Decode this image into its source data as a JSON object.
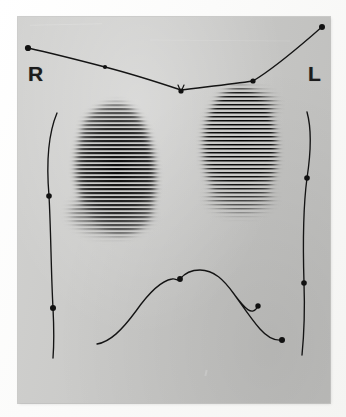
{
  "image": {
    "kind": "lung-perfusion-scintigram",
    "modality_note": "raster-line nuclear medicine scan print",
    "plate": {
      "x": 18,
      "y": 17,
      "width": 312,
      "height": 386,
      "background_color": "#c9c9c7"
    },
    "canvas": {
      "width": 346,
      "height": 417,
      "background_color": "#fbfbfa"
    }
  },
  "labels": {
    "right_side": "R",
    "left_side": "L"
  },
  "colors": {
    "ink": "#141414",
    "plate_grey": "#c9c9c7",
    "mount_white": "#fbfbfa",
    "activity_dark": "#111111"
  },
  "annotations": {
    "apex_marker": "V",
    "markers_total": 11,
    "curves": [
      {
        "name": "upper-thoracic-outline",
        "marker_count": 4
      },
      {
        "name": "right-lateral-chest-wall",
        "marker_count": 2
      },
      {
        "name": "left-lateral-chest-wall",
        "marker_count": 2
      },
      {
        "name": "diaphragm-outline",
        "marker_count": 3
      }
    ],
    "marker_points": [
      {
        "name": "upper-outline-right-end",
        "x": 28,
        "y": 48
      },
      {
        "name": "upper-outline-right-mid",
        "x": 105,
        "y": 67
      },
      {
        "name": "upper-outline-apex",
        "x": 181,
        "y": 90
      },
      {
        "name": "upper-outline-left-mid",
        "x": 253,
        "y": 81
      },
      {
        "name": "upper-outline-left-end",
        "x": 322,
        "y": 27
      },
      {
        "name": "right-wall-upper",
        "x": 49,
        "y": 196
      },
      {
        "name": "right-wall-lower",
        "x": 53,
        "y": 308
      },
      {
        "name": "left-wall-upper",
        "x": 307,
        "y": 178
      },
      {
        "name": "left-wall-lower",
        "x": 304,
        "y": 283
      },
      {
        "name": "diaphragm-centre-notch",
        "x": 180,
        "y": 279
      },
      {
        "name": "diaphragm-left-mid",
        "x": 258,
        "y": 306
      },
      {
        "name": "diaphragm-left-end",
        "x": 282,
        "y": 340
      }
    ]
  },
  "scan_fields": [
    {
      "name": "right-lung-field",
      "side": "right",
      "centre_x": 117,
      "centre_y": 165,
      "width": 86,
      "height": 125,
      "raster_line_spacing_px": 4,
      "relative_uptake": "moderate"
    },
    {
      "name": "left-lung-field",
      "side": "left",
      "centre_x": 243,
      "centre_y": 150,
      "width": 76,
      "height": 118,
      "raster_line_spacing_px": 4,
      "relative_uptake": "high"
    }
  ]
}
